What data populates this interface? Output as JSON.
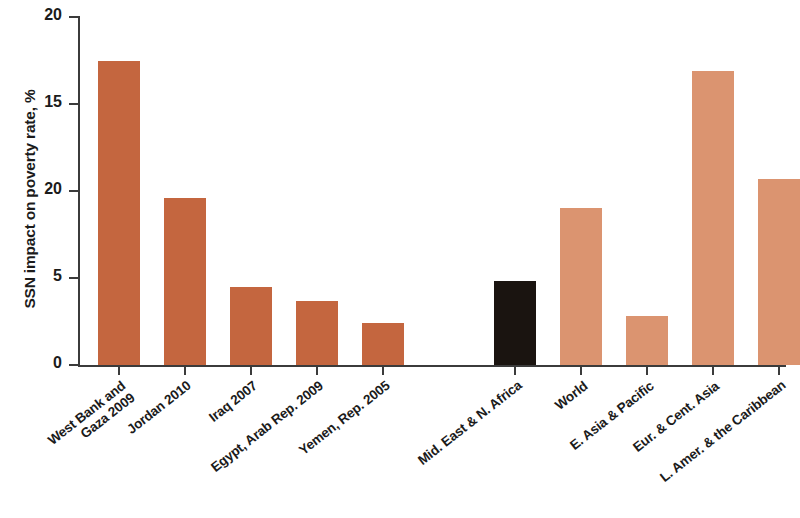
{
  "chart_data": {
    "type": "bar",
    "title": "",
    "xlabel": "",
    "ylabel": "SSN impact on poverty rate, %",
    "ylim": [
      0,
      20
    ],
    "yticks": [
      0,
      5,
      20,
      15,
      20
    ],
    "ytick_labels": [
      "0",
      "5",
      "20",
      "15",
      "20"
    ],
    "grid": false,
    "legend": null,
    "categories": [
      "West Bank and Gaza 2009",
      "Jordan 2010",
      "Iraq 2007",
      "Egypt, Arab Rep. 2009",
      "Yemen, Rep. 2005",
      "Mid. East & N. Africa",
      "World",
      "E. Asia & Pacific",
      "Eur. & Cent. Asia",
      "L. Amer. & the Caribbean"
    ],
    "values": [
      17.5,
      9.6,
      4.5,
      3.7,
      2.4,
      4.8,
      9.0,
      2.8,
      16.9,
      10.7
    ],
    "bar_colors": [
      "#C4663F",
      "#C4663F",
      "#C4663F",
      "#C4663F",
      "#C4663F",
      "#1a1410",
      "#DB9470",
      "#DB9470",
      "#DB9470",
      "#DB9470"
    ]
  },
  "colors": {
    "country_bar": "#C4663F",
    "region_highlight_bar": "#1a1410",
    "region_bar": "#DB9470",
    "axis": "#3b3b3b",
    "text": "#1b1b1b",
    "background": "#ffffff"
  },
  "axis": {
    "y_label": "SSN impact on poverty rate, %",
    "y_ticks": [
      {
        "label": "20",
        "value": 20
      },
      {
        "label": "15",
        "value": 15
      },
      {
        "label": "20",
        "value": 10
      },
      {
        "label": "5",
        "value": 5
      },
      {
        "label": "0",
        "value": 0
      }
    ]
  },
  "bars": [
    {
      "label_line1": "West Bank and",
      "label_line2": "Gaza 2009",
      "value": 17.5,
      "color": "#C4663F",
      "x": 20,
      "width": 42
    },
    {
      "label_line1": "Jordan 2010",
      "label_line2": "",
      "value": 9.6,
      "color": "#C4663F",
      "x": 86,
      "width": 42
    },
    {
      "label_line1": "Iraq 2007",
      "label_line2": "",
      "value": 4.5,
      "color": "#C4663F",
      "x": 152,
      "width": 42
    },
    {
      "label_line1": "Egypt, Arab Rep. 2009",
      "label_line2": "",
      "value": 3.7,
      "color": "#C4663F",
      "x": 218,
      "width": 42
    },
    {
      "label_line1": "Yemen, Rep. 2005",
      "label_line2": "",
      "value": 2.4,
      "color": "#C4663F",
      "x": 284,
      "width": 42
    },
    {
      "label_line1": "Mid. East & N. Africa",
      "label_line2": "",
      "value": 4.8,
      "color": "#1a1410",
      "x": 416,
      "width": 42
    },
    {
      "label_line1": "World",
      "label_line2": "",
      "value": 9.0,
      "color": "#DB9470",
      "x": 482,
      "width": 42
    },
    {
      "label_line1": "E. Asia & Pacific",
      "label_line2": "",
      "value": 2.8,
      "color": "#DB9470",
      "x": 548,
      "width": 42
    },
    {
      "label_line1": "Eur. & Cent. Asia",
      "label_line2": "",
      "value": 16.9,
      "color": "#DB9470",
      "x": 614,
      "width": 42
    },
    {
      "label_line1": "L. Amer. & the Caribbean",
      "label_line2": "",
      "value": 10.7,
      "color": "#DB9470",
      "x": 680,
      "width": 42
    }
  ]
}
